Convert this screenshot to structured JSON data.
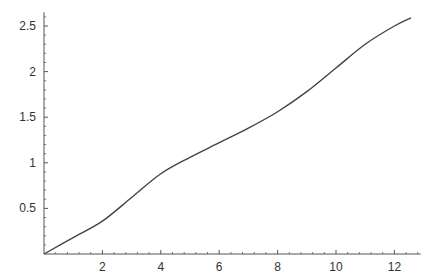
{
  "chart_data": {
    "type": "line",
    "title": "",
    "xlabel": "",
    "ylabel": "",
    "xlim": [
      0,
      12.9
    ],
    "ylim": [
      0,
      2.65
    ],
    "xticks": [
      2,
      4,
      6,
      8,
      10,
      12
    ],
    "yticks": [
      0.5,
      1,
      1.5,
      2,
      2.5
    ],
    "xtick_labels": [
      "2",
      "4",
      "6",
      "8",
      "10",
      "12"
    ],
    "ytick_labels": [
      "0.5",
      "1",
      "1.5",
      "2",
      "2.5"
    ],
    "grid": false,
    "legend": "none",
    "series": [
      {
        "name": "curve",
        "color": "#444444",
        "x": [
          0,
          1,
          2,
          3,
          4,
          5,
          6,
          7,
          8,
          9,
          10,
          11,
          12,
          12.57
        ],
        "y": [
          0,
          0.18,
          0.36,
          0.62,
          0.88,
          1.06,
          1.22,
          1.38,
          1.56,
          1.78,
          2.04,
          2.3,
          2.5,
          2.59
        ]
      }
    ]
  }
}
